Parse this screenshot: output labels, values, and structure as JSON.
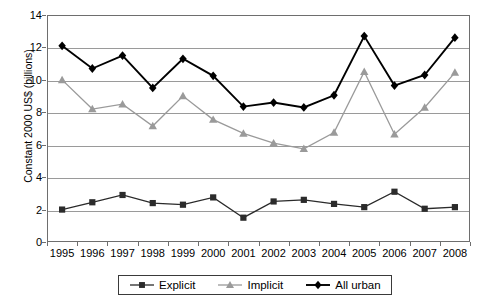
{
  "chart_data": {
    "type": "line",
    "title": "",
    "xlabel": "",
    "ylabel": "Constant 2000 US$ (billions)",
    "x": [
      "1995",
      "1996",
      "1997",
      "1998",
      "1999",
      "2000",
      "2001",
      "2002",
      "2003",
      "2004",
      "2005",
      "2006",
      "2007",
      "2008"
    ],
    "categories": [
      "1995",
      "1996",
      "1997",
      "1998",
      "1999",
      "2000",
      "2001",
      "2002",
      "2003",
      "2004",
      "2005",
      "2006",
      "2007",
      "2008"
    ],
    "xtick_labels": [
      "1995",
      "1996",
      "1997",
      "1998",
      "1999",
      "2000",
      "2001",
      "2002",
      "2003",
      "2004",
      "2005",
      "2006",
      "2007",
      "2008"
    ],
    "ytick_labels": [
      "0",
      "2",
      "4",
      "6",
      "8",
      "10",
      "12",
      "14"
    ],
    "ytick_values": [
      0,
      2,
      4,
      6,
      8,
      10,
      12,
      14
    ],
    "ylim": [
      0,
      14
    ],
    "grid": "horizontal",
    "legend_position": "bottom",
    "series": [
      {
        "name": "Explicit",
        "marker": "square",
        "color": "#2b2b2b",
        "values": [
          2.0,
          2.45,
          2.9,
          2.4,
          2.3,
          2.75,
          1.5,
          2.5,
          2.6,
          2.35,
          2.15,
          3.1,
          2.05,
          2.15
        ]
      },
      {
        "name": "Implicit",
        "marker": "triangle",
        "color": "#9a9a9a",
        "values": [
          10.0,
          8.2,
          8.5,
          7.15,
          9.0,
          7.55,
          6.7,
          6.1,
          5.75,
          6.75,
          10.5,
          6.65,
          8.3,
          10.45
        ]
      },
      {
        "name": "All urban",
        "marker": "diamond",
        "color": "#000000",
        "values": [
          12.1,
          10.7,
          11.5,
          9.5,
          11.3,
          10.25,
          8.35,
          8.6,
          8.3,
          9.05,
          12.7,
          9.65,
          10.3,
          12.6
        ]
      }
    ]
  },
  "legend": {
    "entries": [
      {
        "label": "Explicit",
        "marker": "square",
        "color": "#2b2b2b"
      },
      {
        "label": "Implicit",
        "marker": "triangle",
        "color": "#9a9a9a"
      },
      {
        "label": "All urban",
        "marker": "diamond",
        "color": "#000000"
      }
    ]
  },
  "axes": {
    "y_title": "Constant 2000 US$ (billions)"
  },
  "colors": {
    "frame": "#6e6e6e",
    "grid": "#9a9a9a",
    "background": "#ffffff"
  }
}
